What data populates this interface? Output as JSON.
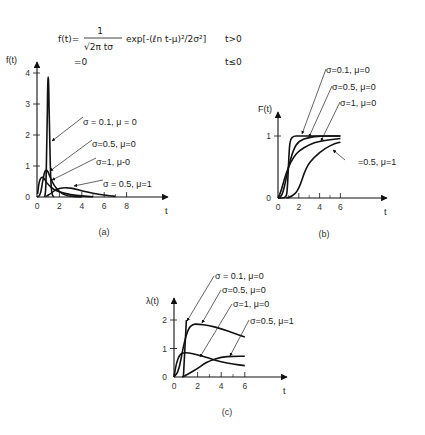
{
  "formula": {
    "line1_lhs": "f(t)=",
    "numerator": "1",
    "denominator": "√2π tσ",
    "exp_part": "exp[-(ℓn t-μ)²/2σ²]",
    "cond1": "t>0",
    "line2_lhs": "=0",
    "cond2": "t≤0"
  },
  "chart_data": [
    {
      "id": "a",
      "type": "line",
      "caption": "(a)",
      "ylabel": "f(t)",
      "xlabel": "t",
      "xticks": [
        "0",
        "2",
        "4",
        "6",
        "8"
      ],
      "yticks": [
        "0",
        "1",
        "2",
        "3",
        "4"
      ],
      "xlim": [
        0,
        10
      ],
      "ylim": [
        0,
        4
      ],
      "legend": [
        "σ = 0.1, μ = 0",
        "σ=0.5, μ=0",
        "σ=1, μ-0",
        "σ = 0.5, μ=1"
      ],
      "series": [
        {
          "name": "σ=0.1, μ=0",
          "x": [
            0.7,
            0.8,
            0.9,
            0.95,
            1.0,
            1.05,
            1.1,
            1.2,
            1.3,
            1.5
          ],
          "y": [
            0.0,
            0.3,
            2.2,
            3.5,
            3.99,
            3.5,
            2.5,
            0.8,
            0.1,
            0.0
          ]
        },
        {
          "name": "σ=0.5, μ=0",
          "x": [
            0,
            0.3,
            0.5,
            0.7,
            0.9,
            1.0,
            1.2,
            1.5,
            2,
            2.5,
            3,
            4
          ],
          "y": [
            0,
            0.06,
            0.5,
            0.85,
            0.87,
            0.8,
            0.62,
            0.38,
            0.16,
            0.06,
            0.02,
            0
          ]
        },
        {
          "name": "σ=1, μ=0",
          "x": [
            0.05,
            0.2,
            0.4,
            0.6,
            0.8,
            1.0,
            1.5,
            2,
            3,
            4,
            5
          ],
          "y": [
            0.1,
            0.52,
            0.65,
            0.62,
            0.5,
            0.4,
            0.24,
            0.16,
            0.07,
            0.03,
            0.01
          ]
        },
        {
          "name": "σ=0.5, μ=1",
          "x": [
            0.8,
            1.2,
            1.6,
            2,
            2.5,
            3,
            3.5,
            4,
            5,
            6,
            7
          ],
          "y": [
            0.02,
            0.1,
            0.22,
            0.28,
            0.3,
            0.29,
            0.25,
            0.2,
            0.12,
            0.06,
            0.02
          ]
        }
      ]
    },
    {
      "id": "b",
      "type": "line",
      "caption": "(b)",
      "ylabel": "F(t)",
      "xlabel": "t",
      "xticks": [
        "0",
        "2",
        "4",
        "6"
      ],
      "yticks": [
        "0",
        "1"
      ],
      "xlim": [
        0,
        9
      ],
      "ylim": [
        0,
        1
      ],
      "legend": [
        "σ=0.1, μ=0",
        "σ=0.5, μ=0",
        "σ=1, μ=0",
        "=0.5, μ=1"
      ],
      "series": [
        {
          "name": "σ=0.1, μ=0",
          "x": [
            0,
            0.8,
            0.9,
            1.0,
            1.1,
            1.2,
            1.5,
            2,
            6
          ],
          "y": [
            0,
            0,
            0.15,
            0.5,
            0.83,
            0.95,
            1.0,
            1.0,
            1.0
          ]
        },
        {
          "name": "σ=0.5, μ=0",
          "x": [
            0,
            0.4,
            0.7,
            1.0,
            1.5,
            2,
            3,
            4,
            6
          ],
          "y": [
            0,
            0.04,
            0.24,
            0.5,
            0.79,
            0.92,
            0.98,
            1.0,
            1.0
          ]
        },
        {
          "name": "σ=1, μ=0",
          "x": [
            0,
            0.3,
            0.6,
            1.0,
            1.5,
            2,
            3,
            4,
            6
          ],
          "y": [
            0,
            0.11,
            0.3,
            0.5,
            0.66,
            0.76,
            0.86,
            0.92,
            0.96
          ]
        },
        {
          "name": "σ=0.5, μ=1",
          "x": [
            0.8,
            1.3,
            2,
            2.7,
            3.5,
            4.5,
            5.5,
            6
          ],
          "y": [
            0,
            0.02,
            0.13,
            0.5,
            0.66,
            0.8,
            0.88,
            0.9
          ]
        }
      ]
    },
    {
      "id": "c",
      "type": "line",
      "caption": "(c)",
      "ylabel": "λ(t)",
      "xlabel": "t",
      "xticks": [
        "0",
        "2",
        "4",
        "6"
      ],
      "yticks": [
        "0",
        "1",
        "2"
      ],
      "xlim": [
        0,
        10
      ],
      "ylim": [
        0,
        2.6
      ],
      "legend": [
        "σ = 0.1, μ=0",
        "σ=0.5, μ=0",
        "σ=1, μ=0",
        "σ=0.5, μ=1"
      ],
      "series": [
        {
          "name": "σ=0.1, μ=0",
          "x": [
            0.8,
            0.9,
            1.0,
            1.05
          ],
          "y": [
            0,
            0.8,
            1.6,
            2.0
          ]
        },
        {
          "name": "σ=0.5, μ=0",
          "x": [
            0,
            0.4,
            0.8,
            1.2,
            1.6,
            2,
            3,
            4,
            5,
            6
          ],
          "y": [
            0,
            0.2,
            1.1,
            1.7,
            1.85,
            1.86,
            1.8,
            1.7,
            1.55,
            1.4
          ]
        },
        {
          "name": "σ=1, μ=0",
          "x": [
            0,
            0.2,
            0.5,
            0.8,
            1.2,
            2,
            3,
            4,
            5,
            6
          ],
          "y": [
            0,
            0.5,
            0.8,
            0.85,
            0.85,
            0.78,
            0.65,
            0.53,
            0.45,
            0.4
          ]
        },
        {
          "name": "σ=0.5, μ=1",
          "x": [
            0.7,
            1.2,
            2,
            2.5,
            3,
            4,
            5,
            6
          ],
          "y": [
            0,
            0.1,
            0.3,
            0.45,
            0.57,
            0.7,
            0.73,
            0.73
          ]
        }
      ]
    }
  ]
}
